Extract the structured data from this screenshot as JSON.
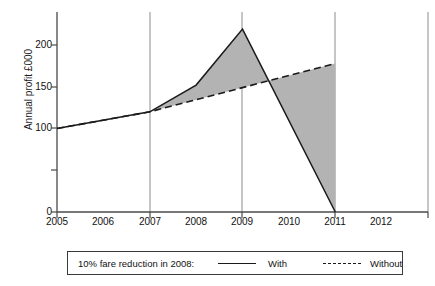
{
  "chart_data": {
    "type": "line",
    "title": "",
    "xlabel": "",
    "ylabel": "Annual profit £000",
    "xlim": [
      2005,
      2013
    ],
    "ylim": [
      0,
      230
    ],
    "yticks": [
      0,
      50,
      100,
      150,
      200
    ],
    "ytick_labels": [
      "0",
      "",
      "100",
      "150",
      "200"
    ],
    "xticks": [
      2005,
      2006,
      2007,
      2008,
      2009,
      2010,
      2011,
      2012
    ],
    "xtick_labels": [
      "2005",
      "2006",
      "2007",
      "2008",
      "2009",
      "2010",
      "2011",
      "2012"
    ],
    "grid": "vertical gridlines at 2007, 2009, 2011",
    "legend_position": "below-plot",
    "shaded_region": {
      "label": "difference between With and Without",
      "color": "#b3b3b3"
    },
    "series": [
      {
        "name": "With",
        "style": "solid",
        "color": "#1a1a1a",
        "x": [
          2005,
          2007,
          2008,
          2009,
          2011
        ],
        "values": [
          100,
          120,
          152,
          219,
          0
        ]
      },
      {
        "name": "Without",
        "style": "dashed",
        "color": "#1a1a1a",
        "x": [
          2005,
          2007,
          2011
        ],
        "values": [
          100,
          120,
          178
        ]
      }
    ]
  },
  "axis": {
    "y_label": "Annual profit £000",
    "y_ticks": [
      {
        "value": 200,
        "label": "200"
      },
      {
        "value": 150,
        "label": "150"
      },
      {
        "value": 100,
        "label": "100"
      },
      {
        "value": 50,
        "label": ""
      },
      {
        "value": 0,
        "label": "0"
      }
    ],
    "x_ticks": [
      {
        "value": 2005,
        "label": "2005"
      },
      {
        "value": 2006,
        "label": "2006"
      },
      {
        "value": 2007,
        "label": "2007"
      },
      {
        "value": 2008,
        "label": "2008"
      },
      {
        "value": 2009,
        "label": "2009"
      },
      {
        "value": 2010,
        "label": "2010"
      },
      {
        "value": 2011,
        "label": "2011"
      },
      {
        "value": 2012,
        "label": "2012"
      }
    ]
  },
  "legend": {
    "caption": "10% fare reduction in 2008:",
    "entries": [
      {
        "label": "With",
        "style": "solid"
      },
      {
        "label": "Without",
        "style": "dashed"
      }
    ]
  }
}
